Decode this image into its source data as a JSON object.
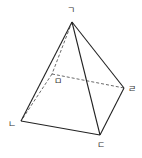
{
  "diagram": {
    "type": "square-pyramid",
    "colors": {
      "stroke": "#222222",
      "label": "#333333",
      "background": "#ffffff"
    },
    "vertices": [
      {
        "id": "apex",
        "label": "ㄱ",
        "x": 72,
        "y": 22,
        "lx": 71,
        "ly": 13
      },
      {
        "id": "front-left",
        "label": "ㄴ",
        "x": 21,
        "y": 121,
        "lx": 12,
        "ly": 127
      },
      {
        "id": "front-right",
        "label": "ㄷ",
        "x": 100,
        "y": 135,
        "lx": 101,
        "ly": 148
      },
      {
        "id": "back-right",
        "label": "ㄹ",
        "x": 124,
        "y": 88,
        "lx": 132,
        "ly": 92
      },
      {
        "id": "back-left",
        "label": "ㅁ",
        "x": 52,
        "y": 74,
        "lx": 58,
        "ly": 84
      }
    ],
    "edges": {
      "solid": [
        [
          "ㄱ",
          "ㄴ"
        ],
        [
          "ㄱ",
          "ㄷ"
        ],
        [
          "ㄱ",
          "ㄹ"
        ],
        [
          "ㄴ",
          "ㄷ"
        ],
        [
          "ㄷ",
          "ㄹ"
        ]
      ],
      "dashed": [
        [
          "ㄱ",
          "ㅁ"
        ],
        [
          "ㅁ",
          "ㄹ"
        ],
        [
          "ㅁ",
          "ㄴ"
        ]
      ]
    }
  }
}
